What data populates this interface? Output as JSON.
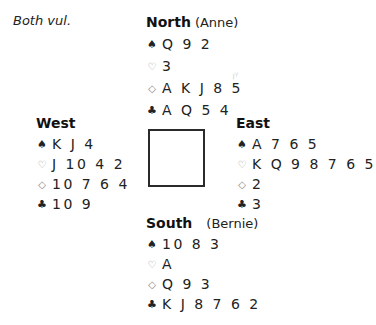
{
  "vulnerability": "Both vul.",
  "suit_icons": {
    "spades": "♠",
    "hearts": "♡",
    "diamonds": "◇",
    "clubs": "♣"
  },
  "hands": {
    "north": {
      "seat": "North",
      "player": "(Anne)",
      "spades": "Q 9 2",
      "hearts": "3",
      "diamonds": "A K J 8 5",
      "clubs": "A Q 5 4"
    },
    "west": {
      "seat": "West",
      "player": "",
      "spades": "K J 4",
      "hearts": "J 10 4 2",
      "diamonds": "10 7 6 4",
      "clubs": "10 9"
    },
    "east": {
      "seat": "East",
      "player": "",
      "spades": "A 7 6 5",
      "hearts": "K Q 9 8 7 6 5",
      "diamonds": "2",
      "clubs": "3"
    },
    "south": {
      "seat": "South",
      "player": "(Bernie)",
      "spades": "10 8 3",
      "hearts": "A",
      "diamonds": "Q 9 3",
      "clubs": "K J 8 7 6 2"
    }
  }
}
